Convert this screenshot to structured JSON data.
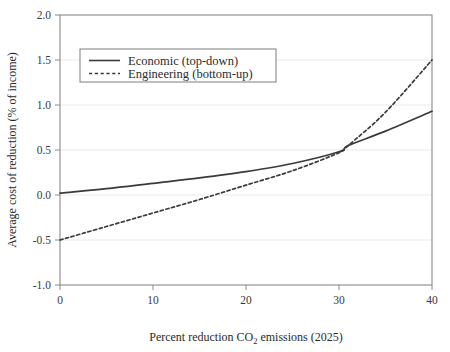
{
  "chart_data": {
    "type": "line",
    "title": "",
    "xlabel_parts": {
      "pre": "Percent reduction CO",
      "sub": "2",
      "post": " emissions (2025)"
    },
    "xlabel": "Percent reduction CO2 emissions (2025)",
    "ylabel": "Average cost of reduction (% of income)",
    "xlim": [
      0,
      40
    ],
    "ylim": [
      -1.0,
      2.0
    ],
    "xticks": [
      0,
      10,
      20,
      30,
      40
    ],
    "xtick_labels": [
      "0",
      "10",
      "20",
      "30",
      "40"
    ],
    "yticks": [
      -1.0,
      -0.5,
      0.0,
      0.5,
      1.0,
      1.5,
      2.0
    ],
    "ytick_labels": [
      "-1.0",
      "-0.5",
      "0.0",
      "0.5",
      "1.0",
      "1.5",
      "2.0"
    ],
    "grid": "horizontal",
    "legend_position": "upper-left-inside",
    "x": [
      0,
      5,
      10,
      15,
      20,
      25,
      30,
      31,
      35,
      40
    ],
    "series": [
      {
        "name": "Economic (top-down)",
        "style": "solid",
        "color": "#3a3a3a",
        "values": [
          0.02,
          0.07,
          0.13,
          0.19,
          0.26,
          0.35,
          0.48,
          0.55,
          0.71,
          0.93
        ]
      },
      {
        "name": "Engineering (bottom-up)",
        "style": "dotted",
        "color": "#3a3a3a",
        "values": [
          -0.5,
          -0.35,
          -0.2,
          -0.05,
          0.11,
          0.27,
          0.47,
          0.55,
          0.92,
          1.5
        ]
      }
    ],
    "colors": {
      "background": "#ffffff",
      "axis": "#8a8a8a",
      "grid": "#e9e9e9",
      "line": "#3a3a3a",
      "text": "#2b2b2b"
    },
    "annotations": []
  },
  "legend": {
    "items": [
      {
        "label": "Economic (top-down)",
        "style": "solid"
      },
      {
        "label": "Engineering (bottom-up)",
        "style": "dotted"
      }
    ]
  }
}
